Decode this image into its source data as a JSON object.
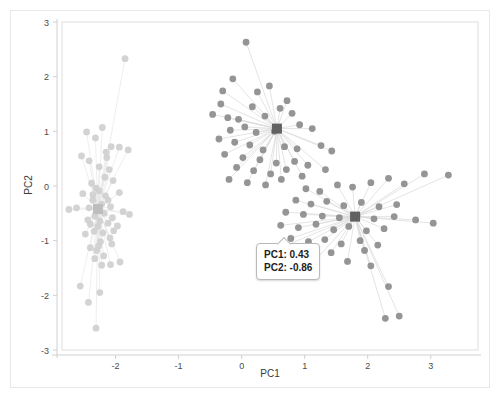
{
  "chart_data": {
    "type": "scatter",
    "title": "",
    "xlabel": "PC1",
    "ylabel": "PC2",
    "xlim": [
      -2.85,
      3.75
    ],
    "ylim": [
      -3.0,
      3.0
    ],
    "xticks": [
      "-2",
      "-1",
      "0",
      "1",
      "2",
      "3"
    ],
    "xtick_values": [
      -2,
      -1,
      0,
      1,
      2,
      3
    ],
    "yticks": [
      "3",
      "2",
      "1",
      "0",
      "-1",
      "-2",
      "-3"
    ],
    "ytick_values": [
      3,
      2,
      1,
      0,
      -1,
      -2,
      -3
    ],
    "grid": false,
    "legend": "none",
    "colors": {
      "cluster_light": "#cfcfcf",
      "cluster_dark": "#8c8c8c",
      "centroid_light": "#bdbdbd",
      "centroid_dark": "#616161",
      "spoke_light": "#e6e6e6",
      "spoke_dark": "#d8d8d8",
      "axis": "#d0d0d0",
      "frame": "#e8e8e8",
      "text": "#3a3a3a"
    },
    "series": [
      {
        "name": "cluster-1",
        "color": "#cfcfcf",
        "centroid": [
          -2.28,
          -0.42
        ],
        "points": [
          [
            -1.85,
            2.33
          ],
          [
            -2.46,
            0.99
          ],
          [
            -2.21,
            1.07
          ],
          [
            -2.32,
            0.88
          ],
          [
            -2.07,
            0.72
          ],
          [
            -1.94,
            0.71
          ],
          [
            -2.54,
            0.55
          ],
          [
            -2.14,
            0.52
          ],
          [
            -2.42,
            0.46
          ],
          [
            -1.8,
            0.66
          ],
          [
            -2.1,
            0.3
          ],
          [
            -2.26,
            0.35
          ],
          [
            -2.17,
            0.16
          ],
          [
            -2.38,
            0.05
          ],
          [
            -2.04,
            0.1
          ],
          [
            -2.31,
            -0.04
          ],
          [
            -2.52,
            -0.14
          ],
          [
            -2.16,
            -0.18
          ],
          [
            -1.94,
            -0.12
          ],
          [
            -2.36,
            -0.26
          ],
          [
            -2.22,
            -0.33
          ],
          [
            -2.08,
            -0.38
          ],
          [
            -2.29,
            -0.44
          ],
          [
            -2.42,
            -0.4
          ],
          [
            -2.18,
            -0.5
          ],
          [
            -2.33,
            -0.55
          ],
          [
            -2.05,
            -0.58
          ],
          [
            -1.88,
            -0.47
          ],
          [
            -1.78,
            -0.52
          ],
          [
            -2.62,
            -0.4
          ],
          [
            -2.25,
            -0.64
          ],
          [
            -2.12,
            -0.68
          ],
          [
            -2.4,
            -0.7
          ],
          [
            -2.28,
            -0.74
          ],
          [
            -1.97,
            -0.73
          ],
          [
            -2.34,
            -0.83
          ],
          [
            -2.2,
            -0.86
          ],
          [
            -2.48,
            -0.88
          ],
          [
            -2.09,
            -0.95
          ],
          [
            -2.24,
            -1.02
          ],
          [
            -2.27,
            -1.1
          ],
          [
            -2.4,
            -1.13
          ],
          [
            -2.3,
            -1.18
          ],
          [
            -2.06,
            -1.06
          ],
          [
            -2.19,
            -1.28
          ],
          [
            -2.33,
            -1.33
          ],
          [
            -2.22,
            -1.45
          ],
          [
            -2.08,
            -1.44
          ],
          [
            -1.93,
            -1.39
          ],
          [
            -2.56,
            -1.83
          ],
          [
            -2.25,
            -1.95
          ],
          [
            -2.43,
            -2.13
          ],
          [
            -2.31,
            -2.6
          ],
          [
            -2.74,
            -0.43
          ],
          [
            -2.15,
            0.62
          ],
          [
            -2.36,
            -0.16
          ],
          [
            -2.12,
            -0.26
          ],
          [
            -2.26,
            -0.09
          ],
          [
            -2.44,
            -0.62
          ],
          [
            -2.03,
            -0.82
          ]
        ]
      },
      {
        "name": "cluster-2",
        "color": "#8c8c8c",
        "centroid": [
          0.56,
          1.05
        ],
        "points": [
          [
            0.07,
            2.63
          ],
          [
            -0.14,
            1.96
          ],
          [
            -0.3,
            1.74
          ],
          [
            -0.33,
            1.5
          ],
          [
            0.25,
            1.72
          ],
          [
            0.44,
            1.83
          ],
          [
            0.17,
            1.45
          ],
          [
            0.72,
            1.56
          ],
          [
            0.61,
            1.42
          ],
          [
            0.8,
            1.33
          ],
          [
            -0.46,
            1.31
          ],
          [
            -0.22,
            1.25
          ],
          [
            -0.05,
            1.22
          ],
          [
            0.37,
            1.28
          ],
          [
            0.05,
            1.08
          ],
          [
            -0.18,
            1.02
          ],
          [
            0.23,
            0.98
          ],
          [
            0.52,
            1.0
          ],
          [
            0.92,
            1.12
          ],
          [
            1.12,
            1.05
          ],
          [
            -0.36,
            0.86
          ],
          [
            -0.11,
            0.8
          ],
          [
            0.13,
            0.75
          ],
          [
            0.34,
            0.66
          ],
          [
            0.68,
            0.72
          ],
          [
            0.88,
            0.68
          ],
          [
            1.26,
            0.74
          ],
          [
            1.43,
            0.64
          ],
          [
            -0.27,
            0.58
          ],
          [
            0.02,
            0.52
          ],
          [
            0.29,
            0.48
          ],
          [
            0.55,
            0.42
          ],
          [
            0.84,
            0.45
          ],
          [
            1.05,
            0.38
          ],
          [
            -0.08,
            0.34
          ],
          [
            0.19,
            0.28
          ],
          [
            0.46,
            0.22
          ],
          [
            0.71,
            0.3
          ],
          [
            1.33,
            0.3
          ],
          [
            -0.2,
            0.12
          ],
          [
            0.09,
            0.06
          ],
          [
            0.38,
            0.02
          ],
          [
            0.63,
            0.12
          ],
          [
            0.96,
            0.18
          ]
        ]
      },
      {
        "name": "cluster-3",
        "color": "#8c8c8c",
        "centroid": [
          1.8,
          -0.56
        ],
        "points": [
          [
            1.02,
            -0.05
          ],
          [
            1.24,
            -0.1
          ],
          [
            1.52,
            0.02
          ],
          [
            1.76,
            -0.02
          ],
          [
            2.05,
            0.06
          ],
          [
            2.33,
            0.14
          ],
          [
            2.58,
            0.04
          ],
          [
            2.9,
            0.22
          ],
          [
            3.28,
            0.2
          ],
          [
            0.86,
            -0.26
          ],
          [
            1.1,
            -0.33
          ],
          [
            1.35,
            -0.28
          ],
          [
            1.62,
            -0.36
          ],
          [
            1.9,
            -0.3
          ],
          [
            2.18,
            -0.38
          ],
          [
            2.46,
            -0.34
          ],
          [
            0.7,
            -0.48
          ],
          [
            0.98,
            -0.52
          ],
          [
            1.28,
            -0.55
          ],
          [
            1.55,
            -0.58
          ],
          [
            1.83,
            -0.54
          ],
          [
            2.1,
            -0.6
          ],
          [
            2.42,
            -0.56
          ],
          [
            2.76,
            -0.62
          ],
          [
            3.04,
            -0.68
          ],
          [
            0.62,
            -0.72
          ],
          [
            0.9,
            -0.76
          ],
          [
            1.18,
            -0.7
          ],
          [
            1.46,
            -0.8
          ],
          [
            1.7,
            -0.74
          ],
          [
            1.98,
            -0.82
          ],
          [
            2.26,
            -0.78
          ],
          [
            0.78,
            -0.96
          ],
          [
            1.06,
            -1.02
          ],
          [
            1.32,
            -0.98
          ],
          [
            1.58,
            -1.06
          ],
          [
            1.88,
            -1.0
          ],
          [
            2.16,
            -1.08
          ],
          [
            0.55,
            -1.16
          ],
          [
            1.42,
            -1.22
          ],
          [
            1.95,
            -1.18
          ],
          [
            2.33,
            -1.84
          ],
          [
            2.28,
            -2.42
          ],
          [
            2.5,
            -2.38
          ],
          [
            1.12,
            -1.42
          ],
          [
            1.68,
            -1.38
          ],
          [
            2.05,
            -1.46
          ]
        ]
      }
    ]
  },
  "tooltip": {
    "visible": true,
    "line1": "PC1: 0.43",
    "line2": "PC2: -0.86"
  }
}
